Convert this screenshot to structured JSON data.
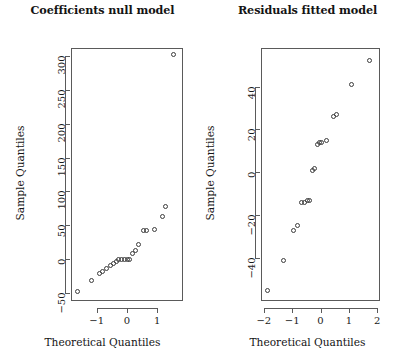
{
  "figure": {
    "layout": "1x2 panel grid of normal Q-Q plots",
    "background": "#ffffff",
    "point_color": "#3c3c3c",
    "axis_color": "#5a5a5a"
  },
  "chart_data": [
    {
      "type": "scatter",
      "panel": "left",
      "title": "Coefficients null model",
      "xlabel": "Theoretical Quantiles",
      "ylabel": "Sample Quantiles",
      "xlim": [
        -1.85,
        1.85
      ],
      "ylim": [
        -62,
        312
      ],
      "grid": false,
      "legend": null,
      "xticks": [
        -1,
        0,
        1
      ],
      "xticklabels": [
        "−1",
        "0",
        "1"
      ],
      "yticks": [
        -50,
        0,
        50,
        100,
        150,
        200,
        250,
        300
      ],
      "yticklabels": [
        "−50",
        "0",
        "50",
        "100",
        "150",
        "200",
        "250",
        "300"
      ],
      "marker": "open-circle",
      "points": [
        {
          "x": -1.64,
          "y": -48
        },
        {
          "x": -1.18,
          "y": -32
        },
        {
          "x": -0.92,
          "y": -21
        },
        {
          "x": -0.8,
          "y": -19
        },
        {
          "x": -0.67,
          "y": -14
        },
        {
          "x": -0.56,
          "y": -10
        },
        {
          "x": -0.46,
          "y": -6
        },
        {
          "x": -0.36,
          "y": -3
        },
        {
          "x": -0.27,
          "y": -1
        },
        {
          "x": -0.18,
          "y": -1
        },
        {
          "x": -0.09,
          "y": -1
        },
        {
          "x": 0.0,
          "y": -1
        },
        {
          "x": 0.09,
          "y": 0
        },
        {
          "x": 0.18,
          "y": 8
        },
        {
          "x": 0.28,
          "y": 13
        },
        {
          "x": 0.37,
          "y": 22
        },
        {
          "x": 0.56,
          "y": 42
        },
        {
          "x": 0.64,
          "y": 42
        },
        {
          "x": 0.92,
          "y": 43
        },
        {
          "x": 1.18,
          "y": 63
        },
        {
          "x": 1.28,
          "y": 77
        },
        {
          "x": 1.55,
          "y": 302
        }
      ]
    },
    {
      "type": "scatter",
      "panel": "right",
      "title": "Residuals fitted model",
      "xlabel": "Theoretical Quantiles",
      "ylabel": "Sample Quantiles",
      "xlim": [
        -2.1,
        2.1
      ],
      "ylim": [
        -60,
        58
      ],
      "grid": false,
      "legend": null,
      "xticks": [
        -2,
        -1,
        0,
        1,
        2
      ],
      "xticklabels": [
        "−2",
        "−1",
        "0",
        "1",
        "2"
      ],
      "yticks": [
        -40,
        -20,
        0,
        20,
        40
      ],
      "yticklabels": [
        "−40",
        "−20",
        "0",
        "20",
        "40"
      ],
      "marker": "open-circle",
      "points": [
        {
          "x": -1.87,
          "y": -55
        },
        {
          "x": -1.29,
          "y": -41
        },
        {
          "x": -0.95,
          "y": -27
        },
        {
          "x": -0.8,
          "y": -25
        },
        {
          "x": -0.67,
          "y": -14
        },
        {
          "x": -0.57,
          "y": -14
        },
        {
          "x": -0.47,
          "y": -13
        },
        {
          "x": -0.39,
          "y": -13
        },
        {
          "x": -0.27,
          "y": 1
        },
        {
          "x": -0.21,
          "y": 2
        },
        {
          "x": -0.09,
          "y": 13
        },
        {
          "x": -0.02,
          "y": 14
        },
        {
          "x": 0.05,
          "y": 14
        },
        {
          "x": 0.22,
          "y": 15
        },
        {
          "x": 0.47,
          "y": 26
        },
        {
          "x": 0.58,
          "y": 27
        },
        {
          "x": 1.09,
          "y": 41
        },
        {
          "x": 1.72,
          "y": 52
        }
      ]
    }
  ]
}
